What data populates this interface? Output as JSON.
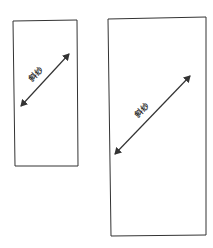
{
  "diagram": {
    "background": "#ffffff",
    "stroke_color": "#333333",
    "panels": [
      {
        "id": "small",
        "rect": {
          "x1": 13,
          "y1": 21,
          "x2": 78,
          "y2": 166
        },
        "arrow": {
          "x1": 21,
          "y1": 106,
          "x2": 69,
          "y2": 54
        },
        "label": "斜纱",
        "label_pos": {
          "x": 38,
          "y": 76
        },
        "label_angle": -46
      },
      {
        "id": "large",
        "rect": {
          "x1": 108,
          "y1": 17,
          "x2": 206,
          "y2": 236
        },
        "arrow": {
          "x1": 115,
          "y1": 154,
          "x2": 190,
          "y2": 76
        },
        "label": "斜纱",
        "label_pos": {
          "x": 144,
          "y": 112
        },
        "label_angle": -46
      }
    ]
  }
}
